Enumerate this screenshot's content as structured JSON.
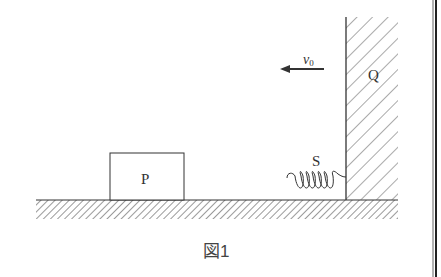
{
  "diagram": {
    "block_label": "P",
    "wall_label": "Q",
    "spring_label": "S",
    "velocity_label": "v",
    "velocity_subscript": "0",
    "caption": "図1",
    "colors": {
      "line": "#333333",
      "hatch": "#555555",
      "background": "#ffffff",
      "border": "#222222"
    }
  }
}
